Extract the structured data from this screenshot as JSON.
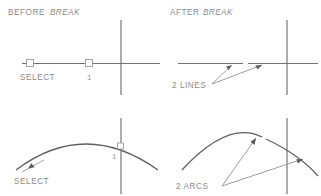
{
  "figure": {
    "title_before": "BEFORE",
    "title_before_emph": "BREAK",
    "title_after": "AFTER",
    "title_after_emph": "BREAK",
    "colors": {
      "background": "#ffffff",
      "geometry": "#6f6f6f",
      "arc": "#5e5e5e",
      "leader": "#8d8d8d",
      "text": "#8a8a8a",
      "arrowhead": "#5a5a5a"
    }
  },
  "panels": {
    "top_left": {
      "name": "before-break-line",
      "heading_plain": "BEFORE",
      "heading_emph": "BREAK",
      "select_label": "SELECT",
      "point_label": "1"
    },
    "top_right": {
      "name": "after-break-line",
      "heading_plain": "AFTER",
      "heading_emph": "BREAK",
      "result_label": "2  LINES"
    },
    "bottom_left": {
      "name": "before-break-arc",
      "select_label": "SELECT",
      "point_label": "1"
    },
    "bottom_right": {
      "name": "after-break-arc",
      "result_label": "2  ARCS"
    }
  }
}
